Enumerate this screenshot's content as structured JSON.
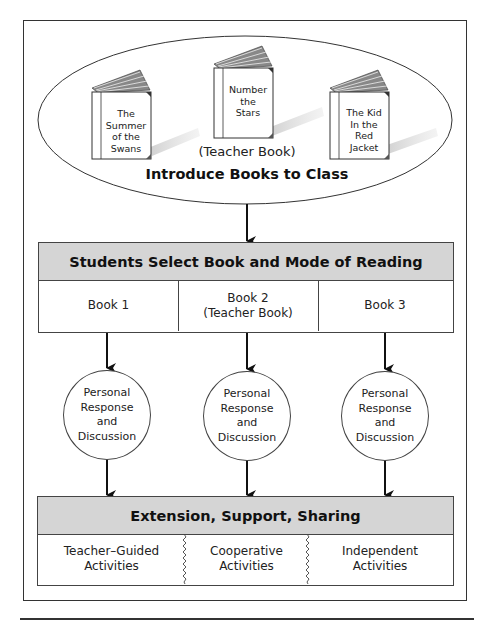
{
  "intro": {
    "books": [
      {
        "title": "The Summer of the Swans",
        "lines": [
          "The",
          "Summer",
          "of the",
          "Swans"
        ]
      },
      {
        "title": "Number the Stars",
        "lines": [
          "Number",
          "the",
          "Stars"
        ]
      },
      {
        "title": "The Kid In the Red Jacket",
        "lines": [
          "The Kid",
          "In the",
          "Red",
          "Jacket"
        ]
      }
    ],
    "teacher_book_caption": "(Teacher Book)",
    "label": "Introduce Books to Class"
  },
  "select": {
    "header": "Students Select Book and Mode of Reading",
    "cells": [
      {
        "line1": "Book 1",
        "line2": ""
      },
      {
        "line1": "Book 2",
        "line2": "(Teacher Book)"
      },
      {
        "line1": "Book 3",
        "line2": ""
      }
    ]
  },
  "response": {
    "nodes": [
      {
        "lines": [
          "Personal",
          "Response",
          "and",
          "Discussion"
        ]
      },
      {
        "lines": [
          "Personal",
          "Response",
          "and",
          "Discussion"
        ]
      },
      {
        "lines": [
          "Personal",
          "Response",
          "and",
          "Discussion"
        ]
      }
    ]
  },
  "extension": {
    "header": "Extension, Support, Sharing",
    "cells": [
      {
        "line1": "Teacher–Guided",
        "line2": "Activities"
      },
      {
        "line1": "Cooperative",
        "line2": "Activities"
      },
      {
        "line1": "Independent",
        "line2": "Activities"
      }
    ]
  },
  "colors": {
    "header_fill": "#d5d5d5",
    "line": "#333333"
  }
}
